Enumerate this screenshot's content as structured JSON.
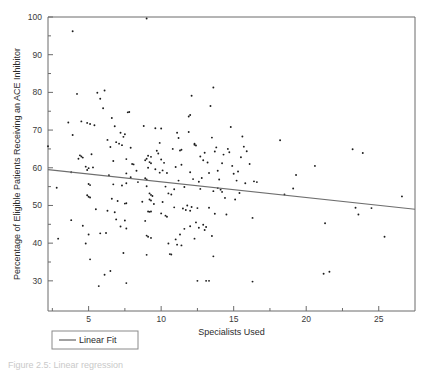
{
  "figure": {
    "caption_partial": "Figure 2.5: Linear regression"
  },
  "legend": {
    "position": "below-axes-left",
    "entries": [
      {
        "label": "Linear Fit",
        "color": "#6e6e6e",
        "marker": "line"
      }
    ]
  },
  "chart_data": {
    "type": "scatter",
    "title": "",
    "xlabel": "Specialists Used",
    "ylabel": "Percentage of Eligible Patients Receiving an ACE Inhibitor",
    "xlim": [
      2.2,
      27.5
    ],
    "ylim": [
      22.0,
      100.0
    ],
    "xticks": [
      5,
      10,
      15,
      20,
      25
    ],
    "yticks": [
      30,
      40,
      50,
      60,
      70,
      80,
      90,
      100
    ],
    "xtick_labels": [
      "5",
      "10",
      "15",
      "20",
      "25"
    ],
    "ytick_labels": [
      "30",
      "40",
      "50",
      "60",
      "70",
      "80",
      "90",
      "100"
    ],
    "grid": false,
    "marker": "dot",
    "marker_color": "#1c1c1c",
    "series": [
      {
        "name": "Hospitals",
        "type": "scatter",
        "points": [
          [
            3.9,
            96.2
          ],
          [
            9.0,
            99.6
          ],
          [
            4.2,
            79.6
          ],
          [
            5.6,
            79.9
          ],
          [
            6.1,
            80.5
          ],
          [
            5.8,
            78.3
          ],
          [
            12.1,
            79.1
          ],
          [
            13.6,
            81.3
          ],
          [
            6.0,
            75.8
          ],
          [
            7.7,
            74.7
          ],
          [
            7.8,
            74.8
          ],
          [
            13.4,
            76.4
          ],
          [
            12.0,
            74.0
          ],
          [
            11.9,
            73.6
          ],
          [
            6.6,
            73.2
          ],
          [
            3.6,
            72.0
          ],
          [
            4.5,
            72.3
          ],
          [
            4.9,
            71.9
          ],
          [
            5.4,
            71.3
          ],
          [
            5.1,
            71.6
          ],
          [
            6.8,
            71.0
          ],
          [
            8.8,
            71.1
          ],
          [
            9.6,
            70.5
          ],
          [
            10.0,
            70.4
          ],
          [
            14.8,
            70.8
          ],
          [
            7.2,
            69.3
          ],
          [
            7.5,
            68.9
          ],
          [
            11.9,
            69.5
          ],
          [
            11.1,
            69.3
          ],
          [
            3.9,
            68.7
          ],
          [
            7.4,
            68.2
          ],
          [
            13.5,
            68.0
          ],
          [
            15.6,
            68.3
          ],
          [
            11.2,
            67.9
          ],
          [
            18.2,
            67.3
          ],
          [
            6.9,
            66.8
          ],
          [
            9.9,
            66.6
          ],
          [
            12.3,
            66.4
          ],
          [
            12.3,
            66.1
          ],
          [
            12.4,
            65.9
          ],
          [
            6.5,
            65.5
          ],
          [
            7.9,
            65.3
          ],
          [
            13.8,
            65.4
          ],
          [
            14.6,
            65.0
          ],
          [
            15.7,
            65.6
          ],
          [
            23.2,
            64.9
          ],
          [
            23.9,
            63.9
          ],
          [
            11.4,
            64.8
          ],
          [
            13.7,
            64.3
          ],
          [
            14.7,
            64.1
          ],
          [
            15.9,
            64.4
          ],
          [
            2.2,
            65.7
          ],
          [
            4.5,
            63.0
          ],
          [
            4.6,
            62.7
          ],
          [
            4.3,
            62.4
          ],
          [
            9.1,
            63.2
          ],
          [
            9.3,
            62.9
          ],
          [
            9.0,
            62.4
          ],
          [
            10.0,
            62.2
          ],
          [
            7.6,
            62.3
          ],
          [
            6.7,
            61.8
          ],
          [
            9.2,
            61.5
          ],
          [
            9.3,
            61.2
          ],
          [
            10.2,
            61.3
          ],
          [
            11.4,
            60.8
          ],
          [
            14.2,
            61.2
          ],
          [
            20.6,
            60.5
          ],
          [
            4.8,
            60.3
          ],
          [
            5.3,
            60.1
          ],
          [
            5.0,
            59.9
          ],
          [
            4.9,
            59.4
          ],
          [
            3.8,
            58.8
          ],
          [
            7.6,
            58.5
          ],
          [
            9.9,
            58.7
          ],
          [
            10.4,
            58.6
          ],
          [
            12.0,
            58.8
          ],
          [
            13.3,
            58.6
          ],
          [
            15.0,
            58.4
          ],
          [
            19.3,
            58.1
          ],
          [
            7.9,
            57.5
          ],
          [
            8.9,
            57.2
          ],
          [
            9.0,
            56.9
          ],
          [
            11.2,
            56.6
          ],
          [
            12.6,
            56.3
          ],
          [
            15.2,
            56.6
          ],
          [
            15.8,
            55.9
          ],
          [
            16.4,
            56.4
          ],
          [
            5.0,
            55.7
          ],
          [
            5.1,
            55.4
          ],
          [
            6.7,
            55.6
          ],
          [
            7.3,
            55.3
          ],
          [
            7.6,
            55.9
          ],
          [
            2.8,
            54.7
          ],
          [
            12.7,
            54.4
          ],
          [
            13.9,
            54.6
          ],
          [
            14.1,
            54.2
          ],
          [
            19.1,
            54.5
          ],
          [
            13.6,
            53.8
          ],
          [
            14.2,
            53.6
          ],
          [
            15.4,
            53.3
          ],
          [
            18.5,
            52.9
          ],
          [
            26.6,
            52.4
          ],
          [
            9.2,
            53.2
          ],
          [
            9.3,
            52.8
          ],
          [
            9.4,
            52.5
          ],
          [
            10.5,
            53.2
          ],
          [
            10.7,
            52.9
          ],
          [
            4.9,
            52.7
          ],
          [
            5.0,
            52.3
          ],
          [
            5.1,
            52.1
          ],
          [
            6.6,
            51.8
          ],
          [
            7.0,
            51.2
          ],
          [
            7.5,
            50.5
          ],
          [
            7.6,
            50.6
          ],
          [
            9.2,
            51.6
          ],
          [
            9.3,
            51.3
          ],
          [
            11.8,
            50.0
          ],
          [
            12.1,
            49.6
          ],
          [
            12.5,
            49.3
          ],
          [
            11.5,
            49.2
          ],
          [
            10.9,
            49.5
          ],
          [
            13.3,
            49.4
          ],
          [
            23.4,
            49.4
          ],
          [
            24.5,
            49.3
          ],
          [
            6.3,
            48.6
          ],
          [
            9.1,
            48.4
          ],
          [
            9.2,
            48.3
          ],
          [
            9.3,
            48.4
          ],
          [
            10.0,
            47.9
          ],
          [
            10.3,
            47.3
          ],
          [
            10.4,
            47.0
          ],
          [
            13.7,
            47.8
          ],
          [
            14.5,
            47.6
          ],
          [
            16.3,
            46.7
          ],
          [
            23.6,
            47.6
          ],
          [
            6.9,
            46.3
          ],
          [
            7.5,
            46.0
          ],
          [
            3.8,
            46.1
          ],
          [
            8.9,
            45.9
          ],
          [
            12.4,
            45.5
          ],
          [
            12.9,
            44.9
          ],
          [
            13.1,
            44.3
          ],
          [
            21.3,
            45.3
          ],
          [
            7.2,
            44.4
          ],
          [
            7.6,
            43.9
          ],
          [
            4.6,
            44.6
          ],
          [
            6.2,
            42.7
          ],
          [
            5.8,
            42.6
          ],
          [
            5.0,
            42.3
          ],
          [
            9.0,
            42.0
          ],
          [
            9.1,
            41.7
          ],
          [
            9.3,
            41.4
          ],
          [
            11.3,
            42.3
          ],
          [
            11.0,
            41.0
          ],
          [
            12.3,
            41.2
          ],
          [
            13.5,
            41.9
          ],
          [
            25.4,
            41.7
          ],
          [
            4.8,
            39.9
          ],
          [
            10.5,
            39.9
          ],
          [
            11.1,
            39.6
          ],
          [
            11.4,
            39.4
          ],
          [
            2.9,
            41.2
          ],
          [
            9.0,
            36.9
          ],
          [
            10.6,
            37.1
          ],
          [
            10.7,
            37.0
          ],
          [
            13.6,
            36.5
          ],
          [
            7.4,
            37.4
          ],
          [
            5.1,
            35.7
          ],
          [
            6.5,
            32.6
          ],
          [
            6.1,
            31.6
          ],
          [
            21.2,
            31.9
          ],
          [
            21.6,
            32.4
          ],
          [
            12.5,
            30.0
          ],
          [
            13.1,
            30.0
          ],
          [
            13.3,
            30.0
          ],
          [
            16.3,
            29.8
          ],
          [
            7.6,
            29.4
          ],
          [
            5.7,
            28.6
          ],
          [
            8.9,
            62.0
          ],
          [
            9.1,
            60.0
          ],
          [
            6.3,
            67.4
          ],
          [
            7.1,
            66.4
          ],
          [
            7.3,
            66.0
          ],
          [
            4.4,
            63.3
          ],
          [
            5.2,
            63.6
          ],
          [
            8.1,
            60.9
          ],
          [
            8.4,
            56.2
          ],
          [
            9.0,
            55.1
          ],
          [
            10.3,
            55.0
          ],
          [
            10.9,
            54.3
          ],
          [
            11.6,
            54.9
          ],
          [
            12.2,
            57.0
          ],
          [
            12.8,
            57.3
          ],
          [
            14.0,
            56.9
          ],
          [
            14.4,
            52.0
          ],
          [
            15.1,
            51.6
          ],
          [
            11.7,
            48.8
          ],
          [
            12.0,
            48.6
          ],
          [
            10.1,
            50.9
          ],
          [
            8.7,
            51.0
          ],
          [
            9.5,
            50.4
          ],
          [
            11.6,
            43.8
          ],
          [
            12.0,
            44.5
          ],
          [
            12.6,
            44.1
          ],
          [
            13.0,
            43.5
          ],
          [
            8.0,
            61.0
          ],
          [
            8.3,
            59.2
          ],
          [
            6.4,
            58.0
          ],
          [
            5.5,
            49.0
          ],
          [
            6.8,
            48.2
          ],
          [
            9.6,
            59.6
          ],
          [
            10.1,
            59.3
          ],
          [
            11.0,
            60.2
          ],
          [
            12.9,
            62.0
          ],
          [
            13.2,
            61.4
          ],
          [
            14.9,
            60.5
          ],
          [
            15.3,
            59.0
          ],
          [
            13.9,
            59.2
          ],
          [
            10.8,
            65.0
          ],
          [
            11.3,
            64.6
          ],
          [
            9.7,
            64.5
          ],
          [
            9.8,
            63.8
          ],
          [
            12.7,
            63.0
          ],
          [
            13.0,
            64.0
          ],
          [
            14.3,
            63.5
          ],
          [
            15.5,
            62.8
          ],
          [
            16.1,
            61.0
          ],
          [
            16.6,
            56.2
          ]
        ]
      },
      {
        "name": "Linear Fit",
        "type": "line",
        "color": "#6e6e6e",
        "endpoints": [
          [
            2.2,
            59.5
          ],
          [
            27.5,
            49.0
          ]
        ],
        "slope": -0.415,
        "intercept": 60.41
      }
    ]
  }
}
